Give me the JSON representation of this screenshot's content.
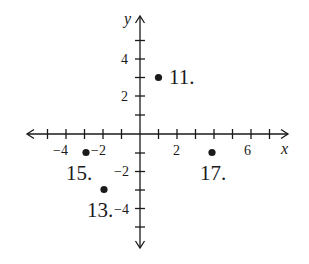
{
  "diagram": {
    "type": "coordinate-plane",
    "colors": {
      "ink": "#1a1a1a",
      "background": "#ffffff"
    },
    "axes": {
      "x_label": "x",
      "y_label": "y",
      "x_range": [
        -5,
        7
      ],
      "y_range": [
        -5,
        5
      ],
      "x_tick_labels": [
        {
          "value": -4,
          "text": "−4"
        },
        {
          "value": -2,
          "text": "−2"
        },
        {
          "value": 2,
          "text": "2"
        },
        {
          "value": 6,
          "text": "6"
        }
      ],
      "y_tick_labels": [
        {
          "value": 4,
          "text": "4"
        },
        {
          "value": 2,
          "text": "2"
        },
        {
          "value": -2,
          "text": "−2"
        },
        {
          "value": -4,
          "text": "−4"
        }
      ]
    },
    "points": [
      {
        "label": "11.",
        "x": 1,
        "y": 3
      },
      {
        "label": "13.",
        "x": -2,
        "y": -3
      },
      {
        "label": "15.",
        "x": -3,
        "y": -1
      },
      {
        "label": "17.",
        "x": 4,
        "y": -1
      }
    ]
  }
}
